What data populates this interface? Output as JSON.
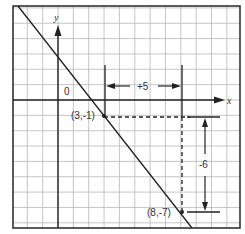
{
  "graph": {
    "axis_labels": {
      "x": "x",
      "y": "y"
    },
    "origin_label": "0",
    "points": [
      {
        "label": "(3,-1)",
        "x": 3,
        "y": -1
      },
      {
        "label": "(8,-7)",
        "x": 8,
        "y": -7
      }
    ],
    "run_label": "+5",
    "rise_label": "-6",
    "line": {
      "slope": -1.2,
      "passes_through": [
        [
          3,
          -1
        ],
        [
          8,
          -7
        ]
      ]
    },
    "grid": {
      "x_range": [
        -3,
        11
      ],
      "y_range": [
        -8,
        6
      ]
    }
  }
}
